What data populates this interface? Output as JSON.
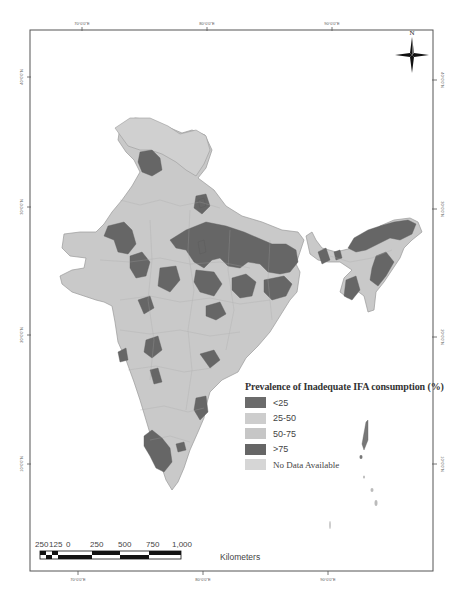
{
  "map": {
    "type": "choropleth",
    "region": "India (district level)",
    "north_arrow_label": "N",
    "longitude_ticks": [
      "70°0'0\"E",
      "80°0'0\"E",
      "90°0'0\"E"
    ],
    "latitude_ticks": [
      "40°0'0\"N",
      "30°0'0\"N",
      "20°0'0\"N",
      "10°0'0\"N"
    ]
  },
  "legend": {
    "title": "Prevalence of Inadequate IFA consumption (%)",
    "items": [
      {
        "label": "<25",
        "color": "#6b6b6b"
      },
      {
        "label": "25-50",
        "color": "#cdcdcd"
      },
      {
        "label": "50-75",
        "color": "#c6c6c6"
      },
      {
        "label": ">75",
        "color": "#666666"
      },
      {
        "label": "No Data Available",
        "color": "#d6d6d6"
      }
    ]
  },
  "scale_bar": {
    "ticks": [
      "250",
      "125",
      "0",
      "250",
      "500",
      "750",
      "1,000"
    ],
    "unit": "Kilometers"
  },
  "colors": {
    "frame": "#444444",
    "light_fill": "#c9c9c9",
    "dark_fill": "#666666",
    "border": "#9a9a9a"
  }
}
